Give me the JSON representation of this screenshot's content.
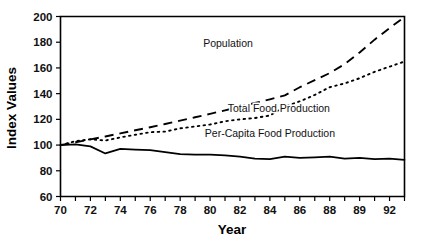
{
  "chart_data": {
    "type": "line",
    "title": "",
    "xlabel": "Year",
    "ylabel": "Index Values",
    "xlim": [
      70,
      93
    ],
    "ylim": [
      60,
      200
    ],
    "grid": false,
    "legend_position": "inline-annotations",
    "y_ticks": [
      60,
      80,
      100,
      120,
      140,
      160,
      180,
      200
    ],
    "y_tick_labels": [
      "60",
      "80",
      "100",
      "120",
      "140",
      "160",
      "180",
      "200"
    ],
    "x_ticks": [
      70,
      71,
      72,
      73,
      74,
      75,
      76,
      77,
      78,
      79,
      80,
      81,
      82,
      83,
      84,
      85,
      86,
      87,
      88,
      89,
      90,
      91,
      92,
      93
    ],
    "x_tick_labels": [
      "70",
      "",
      "72",
      "",
      "74",
      "",
      "76",
      "",
      "78",
      "",
      "80",
      "",
      "82",
      "",
      "84",
      "",
      "86",
      "",
      "88",
      "",
      "89",
      "",
      "92",
      ""
    ],
    "x": [
      70,
      71,
      72,
      73,
      74,
      75,
      76,
      77,
      78,
      79,
      80,
      81,
      82,
      83,
      84,
      85,
      86,
      87,
      88,
      89,
      90,
      91,
      92,
      93
    ],
    "series": [
      {
        "name": "Population",
        "style": "dashed",
        "label": "Population",
        "label_x": 81.2,
        "label_y": 176,
        "values": [
          100,
          102.2,
          104.4,
          106.7,
          109.1,
          111.5,
          113.9,
          116.4,
          119.0,
          121.6,
          124.3,
          127.0,
          129.8,
          132.7,
          135.6,
          138.6,
          145.0,
          150.5,
          156.0,
          163.0,
          172.0,
          182.0,
          191.0,
          199.5
        ]
      },
      {
        "name": "Total Food Production",
        "style": "dotted",
        "label": "Total Food Production",
        "label_x": 84.6,
        "label_y": 126,
        "values": [
          100,
          103.0,
          104.5,
          103.5,
          106.0,
          108.0,
          110.0,
          110.5,
          113.0,
          114.5,
          116.0,
          118.5,
          120.0,
          121.0,
          123.0,
          130.0,
          134.0,
          139.0,
          145.0,
          148.0,
          152.0,
          157.0,
          161.0,
          165.0
        ]
      },
      {
        "name": "Per-Capita Food Production",
        "style": "solid",
        "label": "Per-Capita Food Production",
        "label_x": 84.0,
        "label_y": 106,
        "values": [
          100,
          100.5,
          99.0,
          93.5,
          97.0,
          96.5,
          96.0,
          94.5,
          93.0,
          92.5,
          92.5,
          92.0,
          91.0,
          89.5,
          89.0,
          91.0,
          90.0,
          90.5,
          91.0,
          89.5,
          90.0,
          89.0,
          89.5,
          88.5
        ]
      }
    ]
  }
}
